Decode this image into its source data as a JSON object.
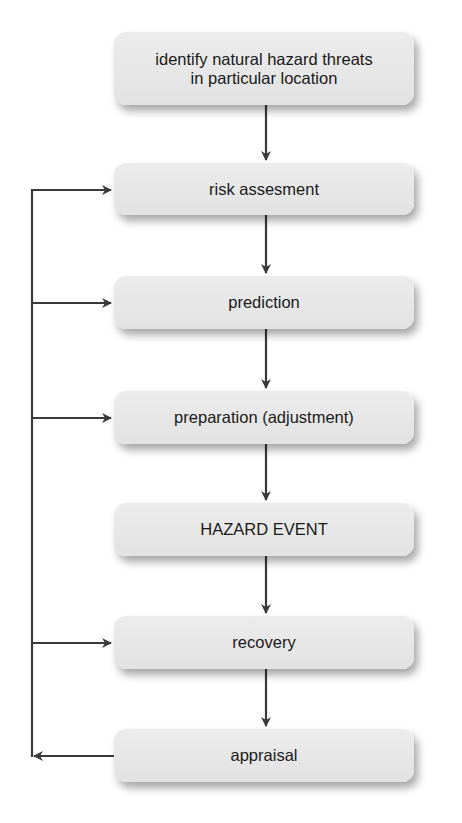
{
  "diagram": {
    "type": "flowchart",
    "colors": {
      "box_fill": "#e6e6e6",
      "line": "#3a3a3a",
      "text": "#1a1a1a"
    },
    "nodes": [
      {
        "id": "identify",
        "line1": "identify natural hazard threats",
        "line2": "in particular location"
      },
      {
        "id": "risk",
        "label": "risk assesment"
      },
      {
        "id": "prediction",
        "label": "prediction"
      },
      {
        "id": "preparation",
        "label": "preparation (adjustment)"
      },
      {
        "id": "hazard",
        "label": "HAZARD EVENT"
      },
      {
        "id": "recovery",
        "label": "recovery"
      },
      {
        "id": "appraisal",
        "label": "appraisal"
      }
    ],
    "edges": [
      {
        "from": "identify",
        "to": "risk"
      },
      {
        "from": "risk",
        "to": "prediction"
      },
      {
        "from": "prediction",
        "to": "preparation"
      },
      {
        "from": "preparation",
        "to": "hazard"
      },
      {
        "from": "hazard",
        "to": "recovery"
      },
      {
        "from": "recovery",
        "to": "appraisal"
      },
      {
        "from": "appraisal",
        "to": "risk",
        "kind": "feedback-loop"
      },
      {
        "from": "appraisal",
        "to": "prediction",
        "kind": "feedback-loop"
      },
      {
        "from": "appraisal",
        "to": "preparation",
        "kind": "feedback-loop"
      },
      {
        "from": "appraisal",
        "to": "recovery",
        "kind": "feedback-loop"
      }
    ]
  }
}
